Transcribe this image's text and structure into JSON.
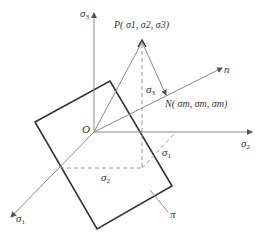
{
  "diagram": {
    "colors": {
      "axis": "#8a8a8a",
      "plane": "#333333",
      "dashed": "#9a9a9a",
      "text": "#333333"
    },
    "labels": {
      "sigma3_axis": "σ",
      "sigma3_axis_sub": "3",
      "sigma2_axis": "σ",
      "sigma2_axis_sub": "2",
      "sigma1_axis": "σ",
      "sigma1_axis_sub": "1",
      "n_axis": "n",
      "origin": "O",
      "point_p": "P( σ1, σ2, σ3)",
      "point_n": "N( σm, σm, σm)",
      "proj_sigma3": "σ",
      "proj_sigma3_sub": "3",
      "proj_sigma1": "σ",
      "proj_sigma1_sub": "1",
      "proj_sigma2": "σ",
      "proj_sigma2_sub": "2",
      "plane": "π"
    },
    "points": {
      "O": [
        94,
        132
      ],
      "P": [
        142,
        41
      ],
      "N": [
        167,
        96
      ],
      "sigma3_end": [
        94,
        12
      ],
      "sigma2_end": [
        252,
        132
      ],
      "sigma1_end": [
        10,
        218
      ],
      "n_end": [
        222,
        68
      ],
      "plane_corners": [
        [
          35,
          122
        ],
        [
          110,
          81
        ],
        [
          172,
          186
        ],
        [
          97,
          229
        ]
      ],
      "foot": [
        142,
        168
      ]
    }
  }
}
